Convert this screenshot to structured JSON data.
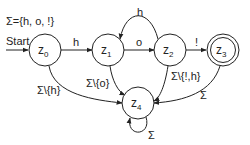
{
  "diagram": {
    "type": "finite-automaton",
    "alphabet_label": "Σ={h, o, !}",
    "start_label": "Start",
    "states": [
      {
        "id": "z0",
        "name": "z",
        "sub": "0",
        "accepting": false,
        "start": true
      },
      {
        "id": "z1",
        "name": "z",
        "sub": "1",
        "accepting": false,
        "start": false
      },
      {
        "id": "z2",
        "name": "z",
        "sub": "2",
        "accepting": false,
        "start": false
      },
      {
        "id": "z3",
        "name": "z",
        "sub": "3",
        "accepting": true,
        "start": false
      },
      {
        "id": "z4",
        "name": "z",
        "sub": "4",
        "accepting": false,
        "start": false
      }
    ],
    "transitions": [
      {
        "from": "z0",
        "to": "z1",
        "label": "h"
      },
      {
        "from": "z1",
        "to": "z2",
        "label": "o"
      },
      {
        "from": "z2",
        "to": "z1",
        "label": "h"
      },
      {
        "from": "z2",
        "to": "z3",
        "label": "!"
      },
      {
        "from": "z0",
        "to": "z4",
        "label": "Σ\\{h}"
      },
      {
        "from": "z1",
        "to": "z4",
        "label": "Σ\\{o}"
      },
      {
        "from": "z2",
        "to": "z4",
        "label": "Σ\\{!,h}"
      },
      {
        "from": "z3",
        "to": "z4",
        "label": "Σ"
      },
      {
        "from": "z4",
        "to": "z4",
        "label": "Σ"
      }
    ]
  }
}
